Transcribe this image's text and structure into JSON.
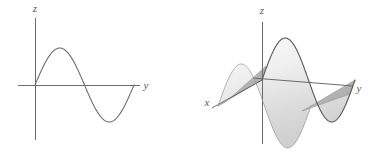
{
  "figure": {
    "name": "sine-curve-and-extruded-sine-surface",
    "background_color": "#ffffff",
    "panel_count": 2
  },
  "style": {
    "axis_color": "#6b6b6b",
    "curve_color": "#6e6e6e",
    "surface_outline_color": "#5d5d5d",
    "surface_fill_light": "#f2f2f2",
    "surface_fill_mid": "#e2e2e2",
    "surface_fill_dark": "#bdbdbd",
    "endcap_fill": "#b5b5b5",
    "label_color": "#5a5a5a",
    "axis_stroke_width": 1.0,
    "curve_stroke_width": 1.1
  },
  "panel_2d": {
    "name": "plane-curve-panel",
    "caption": "",
    "axes": [
      {
        "id": "z",
        "label": "z",
        "orientation": "vertical",
        "label_x": 35,
        "label_y": 12
      },
      {
        "id": "y",
        "label": "y",
        "orientation": "horizontal",
        "label_x": 146,
        "label_y": 89
      }
    ],
    "vertical_axis": {
      "x": 35,
      "y_top": 18,
      "y_bottom": 140
    },
    "horizontal_axis": {
      "y": 85,
      "x_left": 18,
      "x_right": 140
    },
    "curve": {
      "id": "sine-curve",
      "equation": "z = sin(y)",
      "origin_x": 35,
      "origin_y": 85,
      "amplitude_px": 37,
      "period_px": 98,
      "x_start": 35,
      "x_end": 134,
      "peak": {
        "x": 59,
        "y": 48
      },
      "zero_crossing": {
        "x": 84,
        "y": 85
      },
      "trough": {
        "x": 109,
        "y": 122
      }
    }
  },
  "panel_3d": {
    "name": "surface-panel",
    "caption": "",
    "axes": [
      {
        "id": "z",
        "label": "z",
        "orientation": "vertical",
        "label_x": 67,
        "label_y": 14
      },
      {
        "id": "y",
        "label": "y",
        "orientation": "right-down",
        "label_x": 164,
        "label_y": 92
      },
      {
        "id": "x",
        "label": "x",
        "orientation": "down-left",
        "label_x": 12,
        "label_y": 106
      }
    ],
    "origin": {
      "x": 67,
      "y": 80
    },
    "vertical_axis": {
      "x": 67,
      "y_top": 22,
      "y_bottom": 144
    },
    "y_axis": {
      "x_start": 62,
      "y_start": 79,
      "x_end": 158,
      "y_end": 86
    },
    "x_axis": {
      "x_start": 67,
      "y_start": 80,
      "x_end": 17,
      "y_end": 108
    },
    "surface": {
      "id": "extruded-sine-surface",
      "equation": "z = sin(y)",
      "description": "sine profile extruded along the x direction",
      "extrusion_vector": {
        "dx": -44,
        "dy": 26
      },
      "amplitude_px": 42,
      "profile_x_start": 67,
      "profile_x_end": 160,
      "profile_baseline_y": 80
    }
  },
  "chart_data": [
    {
      "type": "line",
      "id": "panel-2d-sine",
      "title": "",
      "xlabel": "y",
      "ylabel": "z",
      "grid": false,
      "legend": null,
      "xlim": [
        0,
        6.2832
      ],
      "ylim": [
        -1.25,
        1.25
      ],
      "series": [
        {
          "name": "z = sin(y)",
          "x": [
            0,
            0.3927,
            0.7854,
            1.1781,
            1.5708,
            1.9635,
            2.3562,
            2.7489,
            3.1416,
            3.5343,
            3.927,
            4.3197,
            4.7124,
            5.1051,
            5.4978,
            5.8905,
            6.2832
          ],
          "y": [
            0,
            0.3827,
            0.7071,
            0.9239,
            1,
            0.9239,
            0.7071,
            0.3827,
            0,
            -0.3827,
            -0.7071,
            -0.9239,
            -1,
            -0.9239,
            -0.7071,
            -0.3827,
            0
          ]
        }
      ]
    },
    {
      "type": "line",
      "id": "panel-3d-sine-surface",
      "title": "",
      "xlabel": "y",
      "ylabel": "z",
      "zlabel": "x",
      "grid": false,
      "legend": null,
      "projection": "3d",
      "surface_equation": "z = sin(y), x free",
      "xlim": [
        0,
        6.2832
      ],
      "ylim": [
        -1.25,
        1.25
      ],
      "series": [
        {
          "name": "z = sin(y) front edge",
          "x": [
            0,
            0.3927,
            0.7854,
            1.1781,
            1.5708,
            1.9635,
            2.3562,
            2.7489,
            3.1416,
            3.5343,
            3.927,
            4.3197,
            4.7124,
            5.1051,
            5.4978,
            5.8905,
            6.2832
          ],
          "y": [
            0,
            0.3827,
            0.7071,
            0.9239,
            1,
            0.9239,
            0.7071,
            0.3827,
            0,
            -0.3827,
            -0.7071,
            -0.9239,
            -1,
            -0.9239,
            -0.7071,
            -0.3827,
            0
          ]
        },
        {
          "name": "z = sin(y) back edge",
          "x": [
            0,
            0.3927,
            0.7854,
            1.1781,
            1.5708,
            1.9635,
            2.3562,
            2.7489,
            3.1416,
            3.5343,
            3.927,
            4.3197,
            4.7124,
            5.1051,
            5.4978,
            5.8905,
            6.2832
          ],
          "y": [
            0,
            0.3827,
            0.7071,
            0.9239,
            1,
            0.9239,
            0.7071,
            0.3827,
            0,
            -0.3827,
            -0.7071,
            -0.9239,
            -1,
            -0.9239,
            -0.7071,
            -0.3827,
            0
          ]
        }
      ]
    }
  ]
}
